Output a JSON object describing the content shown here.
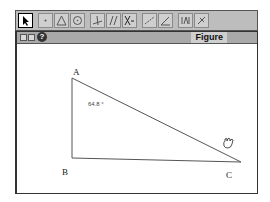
{
  "toolbar": {
    "buttons": [
      {
        "name": "arrow-tool",
        "icon": "arrow-icon",
        "selected": true
      },
      {
        "name": "point-tool",
        "icon": "point-icon"
      },
      {
        "name": "triangle-tool",
        "icon": "triangle-icon"
      },
      {
        "name": "circle-tool",
        "icon": "circle-icon"
      },
      {
        "name": "perpendicular-tool",
        "icon": "perpendicular-icon"
      },
      {
        "name": "parallel-tool",
        "icon": "parallel-icon"
      },
      {
        "name": "intersection-tool",
        "icon": "intersection-icon"
      },
      {
        "name": "measure-tool",
        "icon": "measure-icon"
      },
      {
        "name": "angle-tool",
        "icon": "angle-icon"
      },
      {
        "name": "text-tool",
        "icon": "text-icon"
      },
      {
        "name": "erase-tool",
        "icon": "erase-icon"
      }
    ]
  },
  "window": {
    "title": "Figure",
    "help_glyph": "?"
  },
  "figure": {
    "points": {
      "A": {
        "label": "A"
      },
      "B": {
        "label": "B"
      },
      "C": {
        "label": "C"
      }
    },
    "angle_measure": "64.8 °"
  },
  "colors": {
    "toolbar_bg": "#bdbdbd",
    "titlebar_bg": "#a9a9a9",
    "line": "#555555"
  }
}
